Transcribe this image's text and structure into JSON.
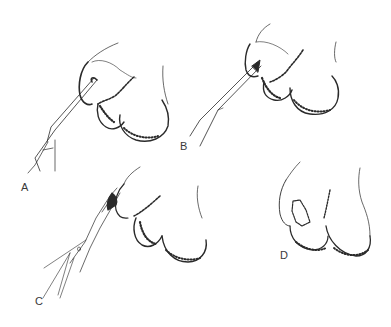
{
  "figure": {
    "panels": [
      {
        "label": "A",
        "x": 21,
        "y": 182
      },
      {
        "label": "B",
        "x": 180,
        "y": 141
      },
      {
        "label": "C",
        "x": 35,
        "y": 296
      },
      {
        "label": "D",
        "x": 280,
        "y": 250
      }
    ],
    "colors": {
      "ink": "#2a2a2a",
      "background": "#ffffff"
    }
  }
}
